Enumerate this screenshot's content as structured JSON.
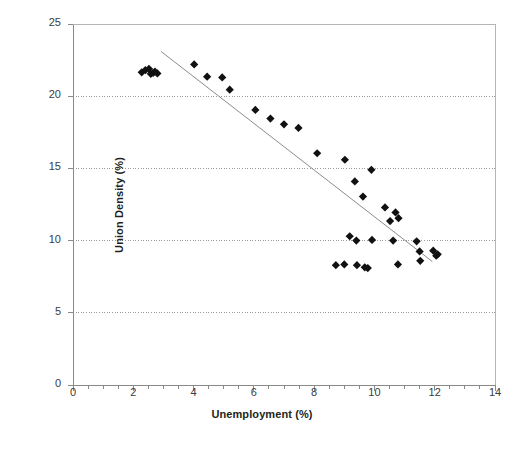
{
  "chart_data": {
    "type": "scatter",
    "title": "",
    "xlabel": "Unemployment (%)",
    "ylabel": "Union Density (%)",
    "xlim": [
      0,
      14
    ],
    "ylim": [
      0,
      25
    ],
    "xticks": [
      0,
      2,
      4,
      6,
      8,
      10,
      12,
      14
    ],
    "yticks": [
      0,
      5,
      10,
      15,
      20,
      25
    ],
    "xtick_labels": [
      "0",
      "2",
      "4",
      "6",
      "8",
      "10",
      "12",
      "14"
    ],
    "ytick_labels": [
      "0",
      "5",
      "10",
      "15",
      "20",
      "25"
    ],
    "x_minor_tick_step": 0.5,
    "grid": "horizontal-dotted",
    "gridlines_y": [
      5,
      10,
      15,
      20,
      25
    ],
    "legend": "none",
    "marker": "diamond",
    "marker_color": "#111111",
    "marker_size": 5,
    "series": [
      {
        "name": "Unemployment vs Union Density",
        "points": [
          [
            2.28,
            21.65
          ],
          [
            2.4,
            21.8
          ],
          [
            2.52,
            21.9
          ],
          [
            2.58,
            21.55
          ],
          [
            2.66,
            21.62
          ],
          [
            2.72,
            21.7
          ],
          [
            2.8,
            21.58
          ],
          [
            4.02,
            22.2
          ],
          [
            4.45,
            21.35
          ],
          [
            4.95,
            21.3
          ],
          [
            5.2,
            20.45
          ],
          [
            6.05,
            19.05
          ],
          [
            6.55,
            18.45
          ],
          [
            7.0,
            18.05
          ],
          [
            7.48,
            17.8
          ],
          [
            8.1,
            16.05
          ],
          [
            9.02,
            15.6
          ],
          [
            9.35,
            14.1
          ],
          [
            9.62,
            13.05
          ],
          [
            9.9,
            14.9
          ],
          [
            10.35,
            12.3
          ],
          [
            10.52,
            11.35
          ],
          [
            10.7,
            11.95
          ],
          [
            10.8,
            11.55
          ],
          [
            9.18,
            10.3
          ],
          [
            9.4,
            10.0
          ],
          [
            9.92,
            10.05
          ],
          [
            10.62,
            10.0
          ],
          [
            11.4,
            9.95
          ],
          [
            11.5,
            9.25
          ],
          [
            11.52,
            8.6
          ],
          [
            11.95,
            9.3
          ],
          [
            12.05,
            8.95
          ],
          [
            12.1,
            9.05
          ],
          [
            8.72,
            8.3
          ],
          [
            9.0,
            8.35
          ],
          [
            9.42,
            8.3
          ],
          [
            9.68,
            8.15
          ],
          [
            9.78,
            8.1
          ],
          [
            10.78,
            8.35
          ]
        ]
      }
    ],
    "trendline": {
      "type": "linear",
      "start": [
        2.92,
        23.1
      ],
      "end": [
        11.92,
        8.55
      ],
      "color": "#8c8c8c"
    }
  }
}
